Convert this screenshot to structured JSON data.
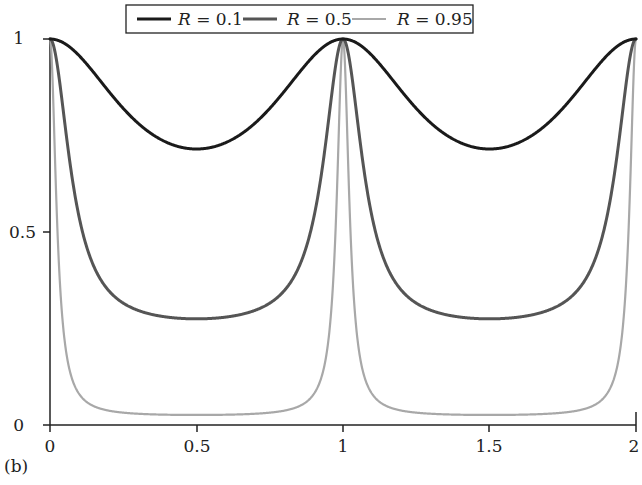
{
  "panel_label": "(b)",
  "legend": {
    "entries": [
      {
        "var": "R",
        "text": " = 0.1",
        "color": "#1a1a1a",
        "width": 3
      },
      {
        "var": "R",
        "text": " = 0.5",
        "color": "#555555",
        "width": 3
      },
      {
        "var": "R",
        "text": " = 0.95",
        "color": "#a8a8a8",
        "width": 2.2
      }
    ]
  },
  "axes": {
    "x_ticks": [
      "0",
      "0.5",
      "1",
      "1.5",
      "2"
    ],
    "y_ticks": [
      "0",
      "0.5",
      "1"
    ]
  },
  "chart_data": {
    "type": "line",
    "title": "",
    "xlabel": "",
    "ylabel": "",
    "xlim": [
      0,
      2
    ],
    "ylim": [
      0,
      1
    ],
    "grid": false,
    "legend_position": "top",
    "x": [
      0,
      0.1,
      0.2,
      0.3,
      0.4,
      0.5,
      0.6,
      0.7,
      0.8,
      0.9,
      1.0,
      1.1,
      1.2,
      1.3,
      1.4,
      1.5,
      1.6,
      1.7,
      1.8,
      1.9,
      2.0
    ],
    "series": [
      {
        "name": "R = 0.1",
        "values": [
          1.0,
          0.956,
          0.865,
          0.782,
          0.732,
          0.715,
          0.732,
          0.782,
          0.865,
          0.956,
          1.0,
          0.956,
          0.865,
          0.782,
          0.732,
          0.715,
          0.732,
          0.782,
          0.865,
          0.956,
          1.0
        ]
      },
      {
        "name": "R = 0.5",
        "values": [
          1.0,
          0.536,
          0.348,
          0.297,
          0.28,
          0.275,
          0.28,
          0.297,
          0.348,
          0.536,
          1.0,
          0.536,
          0.348,
          0.297,
          0.28,
          0.275,
          0.28,
          0.297,
          0.348,
          0.536,
          1.0
        ]
      },
      {
        "name": "R = 0.95",
        "values": [
          1.0,
          0.08,
          0.037,
          0.029,
          0.027,
          0.026,
          0.027,
          0.029,
          0.037,
          0.08,
          1.0,
          0.08,
          0.037,
          0.029,
          0.027,
          0.026,
          0.027,
          0.029,
          0.037,
          0.08,
          1.0
        ]
      }
    ],
    "curve_model": {
      "formula": "T = m + (1-m)(1-s^2)/(1+G s^2), s = sin(pi x)",
      "params": [
        {
          "name": "R = 0.1",
          "m": 0.715,
          "G": 0.71
        },
        {
          "name": "R = 0.5",
          "m": 0.275,
          "G": 15.8
        },
        {
          "name": "R = 0.95",
          "m": 0.026,
          "G": 161
        }
      ]
    }
  }
}
